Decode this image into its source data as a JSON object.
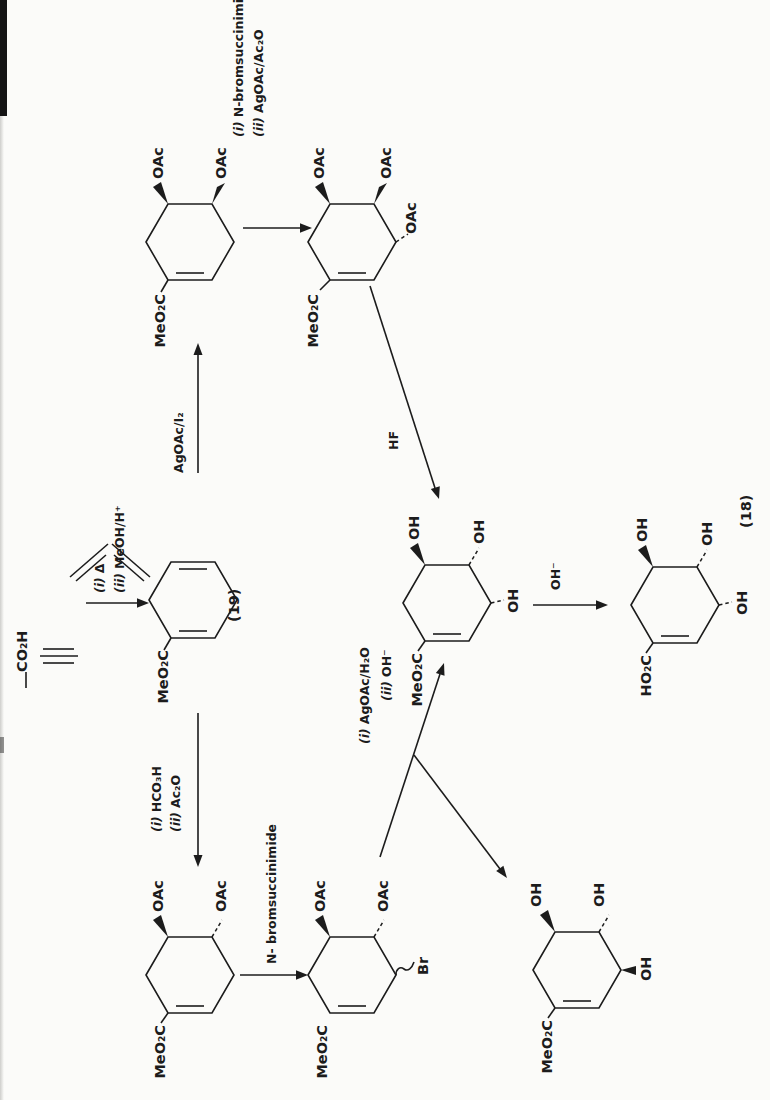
{
  "compounds": {
    "propiolic_acid": {
      "acid_label": "CO₂H"
    },
    "diene_19": {
      "ester_label": "MeO₂C",
      "ref_label": "(19)"
    },
    "cis_diacetate": {
      "ester_label": "MeO₂C",
      "oac_top": "OAc",
      "oac_bottom": "OAc"
    },
    "triacetate": {
      "ester_label": "MeO₂C",
      "oac_top": "OAc",
      "oac_bottom": "OAc",
      "oac_allylic": "OAc"
    },
    "triol_ester": {
      "ester_label": "MeO₂C",
      "oh_top": "OH",
      "oh_mid": "OH",
      "oh_bottom": "OH"
    },
    "shikimic_acid_18": {
      "acid_label": "HO₂C",
      "oh_top": "OH",
      "oh_mid": "OH",
      "oh_bottom": "OH",
      "ref_label": "(18)"
    },
    "trans_diacetate": {
      "ester_label": "MeO₂C",
      "oac_top": "OAc",
      "oac_bottom": "OAc"
    },
    "bromo_diacetate": {
      "ester_label": "MeO₂C",
      "oac_top": "OAc",
      "oac_bottom": "OAc",
      "br_label": "Br"
    },
    "epi_triol_ester": {
      "ester_label": "MeO₂C",
      "oh_top": "OH",
      "oh_mid": "OH",
      "oh_bottom": "OH"
    }
  },
  "reactions": {
    "diels_alder": {
      "step1_marker": "(i)",
      "step1": "Δ",
      "step2_marker": "(ii)",
      "step2": "MeOH/H⁺"
    },
    "wet_prevost": {
      "reagent": "AgOAc/I₂"
    },
    "nbs_then_agoac": {
      "step1_marker": "(i)",
      "step1": "N-bromsuccinimide",
      "step2_marker": "(ii)",
      "step2": "AgOAc/Ac₂O"
    },
    "hf": {
      "reagent": "HF"
    },
    "hydrolysis": {
      "reagent": "OH⁻"
    },
    "performic": {
      "step1_marker": "(i)",
      "step1": "HCO₃H",
      "step2_marker": "(ii)",
      "step2": "Ac₂O"
    },
    "nbs": {
      "reagent": "N- bromsuccinimide"
    },
    "agoac_water": {
      "step1_marker": "(i)",
      "step1": "AgOAc/H₂O",
      "step2_marker": "(ii)",
      "step2": "OH⁻"
    }
  }
}
